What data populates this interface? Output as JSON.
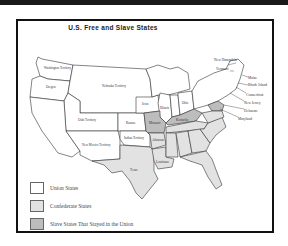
{
  "title": "U.S. Free and Slave States",
  "colors": {
    "union": "#ffffff",
    "confederate": "#e2e2e2",
    "border_slave": "#bdbdbd",
    "outline": "#333333",
    "frame": "#111111"
  },
  "regions": {
    "washington": "Washington Territory",
    "oregon": "Oregon",
    "nebraska": "Nebraska Territory",
    "utah": "Utah Territory",
    "california": "California",
    "new_mexico": "New Mexico Territory",
    "kansas": "Kansas",
    "indian": "Indian Territory",
    "texas": "Texas",
    "iowa": "Iowa",
    "illinois": "Illinois",
    "ohio": "Ohio",
    "missouri": "Missouri",
    "kentucky": "Kentucky",
    "arkansas": "Arkansas",
    "louisiana": "Louisiana",
    "new_york": "New York",
    "pennsylvania": "Pennsylvania"
  },
  "callouts": {
    "new_hampshire": "New Hampshire",
    "vermont": "Vermont",
    "maine": "Maine",
    "rhode_island": "Rhode Island",
    "connecticut": "Connecticut",
    "new_jersey": "New Jersey",
    "delaware": "Delaware",
    "maryland": "Maryland"
  },
  "legend": {
    "items": [
      {
        "label": "Union States",
        "color": "#ffffff"
      },
      {
        "label": "Confederate States",
        "color": "#e2e2e2"
      },
      {
        "label": "Slave States That Stayed in the Union",
        "color": "#bdbdbd"
      }
    ]
  }
}
